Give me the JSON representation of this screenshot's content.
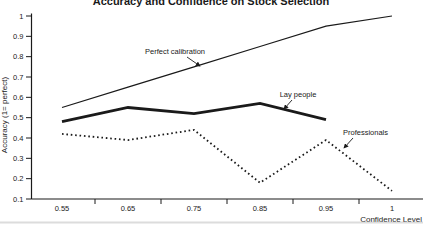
{
  "title": "Accuracy and Confidence on Stock Selection",
  "chart_data": {
    "type": "line",
    "title": "Accuracy and Confidence on Stock Selection",
    "xlabel": "Confidence Level",
    "ylabel": "Accuracy (1= perfect)",
    "x_tick_labels": [
      "0.55",
      "0.65",
      "0.75",
      "0.85",
      "0.95",
      "1"
    ],
    "y_tick_labels": [
      "1",
      "0.9",
      "0.8",
      "0.7",
      "0.6",
      "0.5",
      "0.4",
      "0.3",
      "0.2",
      "0.1"
    ],
    "ylim": [
      0.1,
      1.0
    ],
    "grid": false,
    "legend_position": "inline-annotations",
    "series": [
      {
        "name": "Perfect calibration",
        "style": "thin-solid",
        "values": [
          0.55,
          0.65,
          0.75,
          0.85,
          0.95,
          1.0
        ]
      },
      {
        "name": "Lay people",
        "style": "thick-solid",
        "values": [
          0.48,
          0.55,
          0.52,
          0.57,
          0.49,
          null
        ]
      },
      {
        "name": "Professionals",
        "style": "dotted",
        "values": [
          0.42,
          0.39,
          0.44,
          0.18,
          0.39,
          0.14
        ]
      }
    ],
    "annotations": [
      {
        "text": "Perfect calibration",
        "x": 175,
        "y": 54,
        "anchor": "middle",
        "arrow": {
          "x1": 187,
          "y1": 57,
          "x2": 200,
          "y2": 66
        }
      },
      {
        "text": "Lay people",
        "x": 298,
        "y": 97,
        "anchor": "middle",
        "arrow": {
          "x1": 292,
          "y1": 100,
          "x2": 284,
          "y2": 109
        }
      },
      {
        "text": "Professionals",
        "x": 343,
        "y": 135,
        "anchor": "start",
        "arrow": {
          "x1": 353,
          "y1": 138,
          "x2": 344,
          "y2": 148
        }
      }
    ],
    "colors": {
      "line": "#1a1a1a",
      "text": "#1a1a1a",
      "background": "#ffffff",
      "scan_artifact": "#bfbfbf"
    }
  }
}
